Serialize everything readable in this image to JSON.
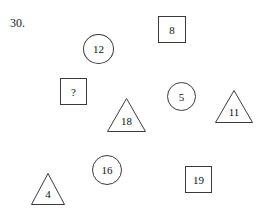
{
  "worksheet": {
    "problem_number": "30.",
    "background_color": "#ffffff",
    "stroke_color": "#3a3a3a",
    "text_color": "#111111",
    "width": 266,
    "height": 218
  },
  "shapes": [
    {
      "id": "square-8",
      "kind": "square",
      "label": "8",
      "x": 158,
      "y": 16,
      "w": 28,
      "h": 27
    },
    {
      "id": "circle-12",
      "kind": "circle",
      "label": "12",
      "x": 83,
      "y": 34,
      "w": 31,
      "h": 30
    },
    {
      "id": "square-q",
      "kind": "square",
      "label": "?",
      "x": 60,
      "y": 78,
      "w": 27,
      "h": 27
    },
    {
      "id": "circle-5",
      "kind": "circle",
      "label": "5",
      "x": 167,
      "y": 82,
      "w": 29,
      "h": 29
    },
    {
      "id": "triangle-11",
      "kind": "triangle",
      "label": "11",
      "x": 215,
      "y": 90,
      "w": 38,
      "h": 33
    },
    {
      "id": "triangle-18",
      "kind": "triangle",
      "label": "18",
      "x": 107,
      "y": 98,
      "w": 39,
      "h": 34
    },
    {
      "id": "circle-16",
      "kind": "circle",
      "label": "16",
      "x": 92,
      "y": 155,
      "w": 30,
      "h": 30
    },
    {
      "id": "square-19",
      "kind": "square",
      "label": "19",
      "x": 185,
      "y": 166,
      "w": 27,
      "h": 27
    },
    {
      "id": "triangle-4",
      "kind": "triangle",
      "label": "4",
      "x": 31,
      "y": 173,
      "w": 34,
      "h": 32
    }
  ]
}
